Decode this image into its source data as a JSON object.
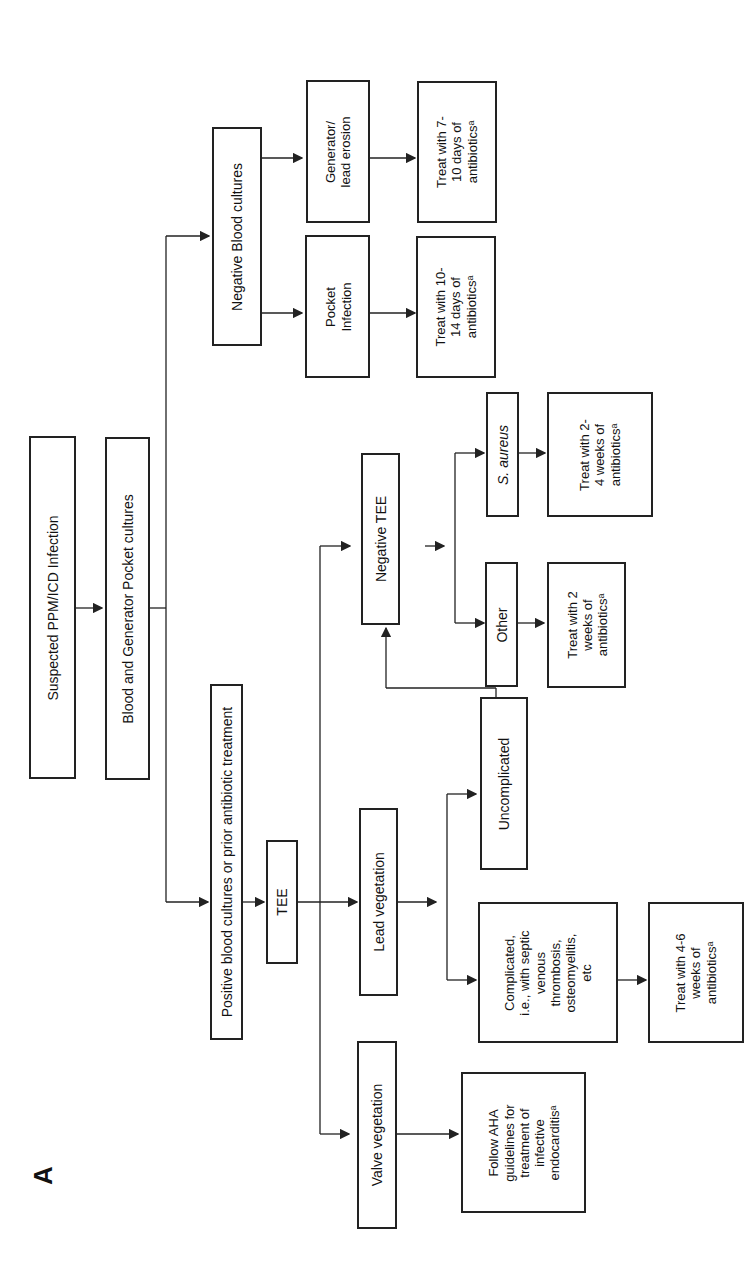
{
  "panel_label": "A",
  "nodes": {
    "suspected": "Suspected PPM/ICD Infection",
    "cultures": "Blood and Generator Pocket cultures",
    "positive": "Positive blood cultures or prior antibiotic treatment",
    "negative_blood": "Negative Blood cultures",
    "pocket_infection": "Pocket\nInfection",
    "generator_erosion": "Generator/\nlead erosion",
    "treat_10_14": "Treat with 10-\n14 days of\nantibioticsᵃ",
    "treat_7_10": "Treat with 7-\n10 days of\nantibioticsᵃ",
    "tee": "TEE",
    "valve_veg": "Valve vegetation",
    "lead_veg": "Lead vegetation",
    "negative_tee": "Negative TEE",
    "follow_aha": "Follow AHA\nguidelines for\ntreatment of\ninfective\nendocarditisᵃ",
    "complicated": "Complicated,\ni.e., with septic\nvenous\nthrombosis,\nosteomyelitis,\netc",
    "uncomplicated": "Uncomplicated",
    "treat_4_6": "Treat with 4-6\nweeks of\nantibioticsᵃ",
    "other": "Other",
    "s_aureus": "S. aureus",
    "treat_2": "Treat with 2\nweeks of\nantibioticsᵃ",
    "treat_2_4": "Treat with 2-\n4 weeks of\nantibioticsᵃ"
  }
}
